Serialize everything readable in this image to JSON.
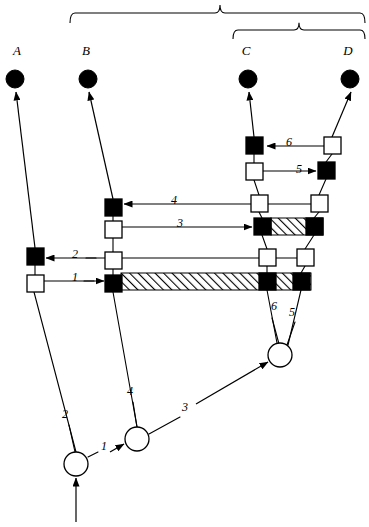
{
  "figure": {
    "type": "cladogram-character-state-diagram",
    "background_color": "#ffffff",
    "line_color": "#000000",
    "filled_color": "#000000",
    "open_color": "#ffffff",
    "width": 369,
    "height": 527
  },
  "taxa": [
    {
      "id": "A",
      "label": "A",
      "label_x": 17,
      "label_y": 55,
      "terminal_x": 15,
      "terminal_y": 79,
      "terminal_r": 9,
      "terminal_state": "filled"
    },
    {
      "id": "B",
      "label": "B",
      "label_x": 86,
      "label_y": 55,
      "terminal_x": 88,
      "terminal_y": 79,
      "terminal_r": 9,
      "terminal_state": "filled"
    },
    {
      "id": "C",
      "label": "C",
      "label_x": 246,
      "label_y": 55,
      "terminal_x": 248,
      "terminal_y": 79,
      "terminal_r": 9,
      "terminal_state": "filled"
    },
    {
      "id": "D",
      "label": "D",
      "label_x": 348,
      "label_y": 55,
      "terminal_x": 350,
      "terminal_y": 79,
      "terminal_r": 9,
      "terminal_state": "filled"
    }
  ],
  "braces": [
    {
      "name": "outer-brace",
      "x_left": 70,
      "x_right": 365,
      "x_mid": 220,
      "y_bar": 13,
      "height": 10
    },
    {
      "name": "inner-brace",
      "x_left": 233,
      "x_right": 365,
      "x_mid": 299,
      "y_bar": 30,
      "height": 9
    }
  ],
  "squares": [
    {
      "name": "square-a-upper",
      "x": 27,
      "y": 248,
      "size": 17,
      "state": "filled"
    },
    {
      "name": "square-a-lower",
      "x": 27,
      "y": 275,
      "size": 17,
      "state": "open"
    },
    {
      "name": "square-b-4",
      "x": 105,
      "y": 199,
      "size": 17,
      "state": "filled"
    },
    {
      "name": "square-b-3",
      "x": 105,
      "y": 221,
      "size": 17,
      "state": "open"
    },
    {
      "name": "square-b-2",
      "x": 105,
      "y": 252,
      "size": 17,
      "state": "open"
    },
    {
      "name": "square-b-1",
      "x": 105,
      "y": 275,
      "size": 17,
      "state": "filled"
    },
    {
      "name": "square-c-6",
      "x": 246,
      "y": 137,
      "size": 17,
      "state": "filled"
    },
    {
      "name": "square-c-5",
      "x": 246,
      "y": 163,
      "size": 17,
      "state": "open"
    },
    {
      "name": "square-c-4",
      "x": 251,
      "y": 195,
      "size": 17,
      "state": "open"
    },
    {
      "name": "square-c-3",
      "x": 254,
      "y": 218,
      "size": 17,
      "state": "filled"
    },
    {
      "name": "square-c-2",
      "x": 259,
      "y": 249,
      "size": 17,
      "state": "open"
    },
    {
      "name": "square-c-1",
      "x": 259,
      "y": 273,
      "size": 17,
      "state": "filled"
    },
    {
      "name": "square-d-6",
      "x": 324,
      "y": 137,
      "size": 17,
      "state": "open"
    },
    {
      "name": "square-d-5",
      "x": 318,
      "y": 162,
      "size": 17,
      "state": "filled"
    },
    {
      "name": "square-d-4",
      "x": 311,
      "y": 195,
      "size": 17,
      "state": "open"
    },
    {
      "name": "square-d-3",
      "x": 306,
      "y": 218,
      "size": 17,
      "state": "filled"
    },
    {
      "name": "square-d-2",
      "x": 297,
      "y": 249,
      "size": 17,
      "state": "open"
    },
    {
      "name": "square-d-1",
      "x": 293,
      "y": 273,
      "size": 17,
      "state": "filled"
    }
  ],
  "circles": [
    {
      "name": "circle-root",
      "cx": 76,
      "cy": 464,
      "r": 12,
      "state": "open"
    },
    {
      "name": "circle-node-1",
      "cx": 137,
      "cy": 439,
      "r": 12,
      "state": "open"
    },
    {
      "name": "circle-node-3",
      "cx": 280,
      "cy": 355,
      "r": 12,
      "state": "open"
    }
  ],
  "event_labels": [
    {
      "name": "event-label-6-top",
      "text": "6",
      "x": 289,
      "y": 146
    },
    {
      "name": "event-label-5-top",
      "text": "5",
      "x": 299,
      "y": 173
    },
    {
      "name": "event-label-4-mid",
      "text": "4",
      "x": 174,
      "y": 204
    },
    {
      "name": "event-label-3-mid",
      "text": "3",
      "x": 180,
      "y": 227
    },
    {
      "name": "event-label-2-mid",
      "text": "2",
      "x": 75,
      "y": 258
    },
    {
      "name": "event-label-1-mid",
      "text": "1",
      "x": 75,
      "y": 281
    },
    {
      "name": "event-label-6-lower",
      "text": "6",
      "x": 274,
      "y": 310
    },
    {
      "name": "event-label-5-lower",
      "text": "5",
      "x": 292,
      "y": 316
    },
    {
      "name": "event-label-4-bottom",
      "text": "4",
      "x": 130,
      "y": 395
    },
    {
      "name": "event-label-3-bottom",
      "text": "3",
      "x": 185,
      "y": 411
    },
    {
      "name": "event-label-2-bottom",
      "text": "2",
      "x": 65,
      "y": 418
    },
    {
      "name": "event-label-1-bottom",
      "text": "1",
      "x": 104,
      "y": 450
    }
  ],
  "hatched_bars": [
    {
      "name": "hatched-bar-upper",
      "x": 271,
      "y": 218,
      "width": 52,
      "height": 17
    },
    {
      "name": "hatched-bar-lower",
      "x": 121,
      "y": 273,
      "width": 190,
      "height": 17
    }
  ],
  "arrows": [
    {
      "name": "arrow-a-terminal",
      "from_x": 35,
      "from_y": 248,
      "to_x": 16,
      "to_y": 92
    },
    {
      "name": "arrow-b-terminal",
      "from_x": 113,
      "from_y": 199,
      "to_x": 89,
      "to_y": 92
    },
    {
      "name": "arrow-c-terminal",
      "from_x": 254,
      "from_y": 137,
      "to_x": 249,
      "to_y": 92
    },
    {
      "name": "arrow-d-terminal",
      "from_x": 332,
      "from_y": 137,
      "to_x": 351,
      "to_y": 92
    },
    {
      "name": "arrow-event-6",
      "from_x": 324,
      "from_y": 146,
      "to_x": 267,
      "to_y": 146
    },
    {
      "name": "arrow-event-5",
      "from_x": 263,
      "from_y": 171,
      "to_x": 316,
      "to_y": 171
    },
    {
      "name": "arrow-event-4",
      "from_x": 251,
      "from_y": 204,
      "to_x": 124,
      "to_y": 204
    },
    {
      "name": "arrow-event-3",
      "from_x": 122,
      "from_y": 227,
      "to_x": 252,
      "to_y": 227
    },
    {
      "name": "arrow-event-2",
      "from_x": 105,
      "from_y": 258,
      "to_x": 46,
      "to_y": 258
    },
    {
      "name": "arrow-event-1",
      "from_x": 44,
      "from_y": 281,
      "to_x": 104,
      "to_y": 281
    },
    {
      "name": "arrow-root-in",
      "from_x": 76,
      "from_y": 522,
      "to_x": 76,
      "to_y": 478
    },
    {
      "name": "arrow-node-1",
      "from_x": 110,
      "from_y": 452,
      "to_x": 124,
      "to_y": 444
    },
    {
      "name": "arrow-node-3",
      "from_x": 196,
      "from_y": 404,
      "to_x": 268,
      "to_y": 362
    }
  ],
  "connector_lines": [
    {
      "name": "line-a-chain",
      "x1": 35,
      "y1": 265,
      "x2": 35,
      "y2": 275
    },
    {
      "name": "line-a-down",
      "x1": 34,
      "y1": 292,
      "x2": 76,
      "y2": 452
    },
    {
      "name": "line-b-4-3",
      "x1": 113,
      "y1": 216,
      "x2": 113,
      "y2": 221
    },
    {
      "name": "line-b-3-2",
      "x1": 113,
      "y1": 238,
      "x2": 113,
      "y2": 252
    },
    {
      "name": "line-b-2-1",
      "x1": 113,
      "y1": 269,
      "x2": 113,
      "y2": 275
    },
    {
      "name": "line-b-down",
      "x1": 113,
      "y1": 292,
      "x2": 137,
      "y2": 427
    },
    {
      "name": "line-c-6-5",
      "x1": 254,
      "y1": 154,
      "x2": 254,
      "y2": 163
    },
    {
      "name": "line-c-5-4",
      "x1": 254,
      "y1": 180,
      "x2": 259,
      "y2": 195
    },
    {
      "name": "line-c-4-3",
      "x1": 259,
      "y1": 212,
      "x2": 262,
      "y2": 218
    },
    {
      "name": "line-c-3-2",
      "x1": 262,
      "y1": 235,
      "x2": 267,
      "y2": 249
    },
    {
      "name": "line-c-2-1",
      "x1": 267,
      "y1": 266,
      "x2": 267,
      "y2": 273
    },
    {
      "name": "line-c-down",
      "x1": 267,
      "y1": 290,
      "x2": 277,
      "y2": 343
    },
    {
      "name": "line-d-6-5",
      "x1": 332,
      "y1": 154,
      "x2": 326,
      "y2": 162
    },
    {
      "name": "line-d-5-4",
      "x1": 326,
      "y1": 179,
      "x2": 319,
      "y2": 195
    },
    {
      "name": "line-d-4-3",
      "x1": 319,
      "y1": 212,
      "x2": 314,
      "y2": 218
    },
    {
      "name": "line-d-3-2",
      "x1": 314,
      "y1": 235,
      "x2": 305,
      "y2": 249
    },
    {
      "name": "line-d-2-1",
      "x1": 305,
      "y1": 266,
      "x2": 301,
      "y2": 273
    },
    {
      "name": "line-d-down",
      "x1": 301,
      "y1": 290,
      "x2": 288,
      "y2": 345
    },
    {
      "name": "line-crossbar-2",
      "x1": 122,
      "y1": 258,
      "x2": 259,
      "y2": 258
    },
    {
      "name": "line-crossbar-2b",
      "x1": 276,
      "y1": 258,
      "x2": 297,
      "y2": 258
    },
    {
      "name": "line-crossbar-4b",
      "x1": 268,
      "y1": 204,
      "x2": 311,
      "y2": 204
    },
    {
      "name": "line-label-2-tick",
      "x1": 86,
      "y1": 258,
      "x2": 96,
      "y2": 258
    },
    {
      "name": "line-label-1-tick",
      "x1": 84,
      "y1": 281,
      "x2": 94,
      "y2": 281
    },
    {
      "name": "line-6-lower-tick",
      "x1": 272,
      "y1": 318,
      "x2": 279,
      "y2": 344
    },
    {
      "name": "line-5-lower-tick",
      "x1": 295,
      "y1": 322,
      "x2": 287,
      "y2": 345
    },
    {
      "name": "line-4-bottom-tick",
      "x1": 133,
      "y1": 402,
      "x2": 137,
      "y2": 427
    },
    {
      "name": "line-2-bottom-tick",
      "x1": 69,
      "y1": 425,
      "x2": 75,
      "y2": 452
    },
    {
      "name": "line-1-bottom-tick",
      "x1": 88,
      "y1": 457,
      "x2": 98,
      "y2": 452
    },
    {
      "name": "line-3-bottom-tick",
      "x1": 149,
      "y1": 434,
      "x2": 180,
      "y2": 417
    }
  ]
}
